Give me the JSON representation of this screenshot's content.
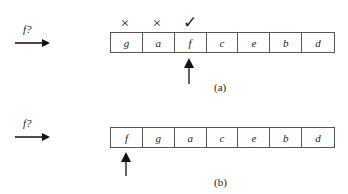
{
  "diagram": {
    "panel_a": {
      "caption": "(a)",
      "query_label": "f?",
      "cells": [
        "g",
        "a",
        "f",
        "c",
        "e",
        "b",
        "d"
      ],
      "marks": [
        {
          "cell_index": 0,
          "symbol": "×",
          "meaning": "cross"
        },
        {
          "cell_index": 1,
          "symbol": "×",
          "meaning": "cross"
        },
        {
          "cell_index": 2,
          "symbol": "✓",
          "meaning": "check"
        }
      ],
      "pointer_cell_index": 2
    },
    "panel_b": {
      "caption": "(b)",
      "query_label": "f?",
      "cells": [
        "f",
        "g",
        "a",
        "c",
        "e",
        "b",
        "d"
      ],
      "pointer_cell_index": 0
    }
  }
}
